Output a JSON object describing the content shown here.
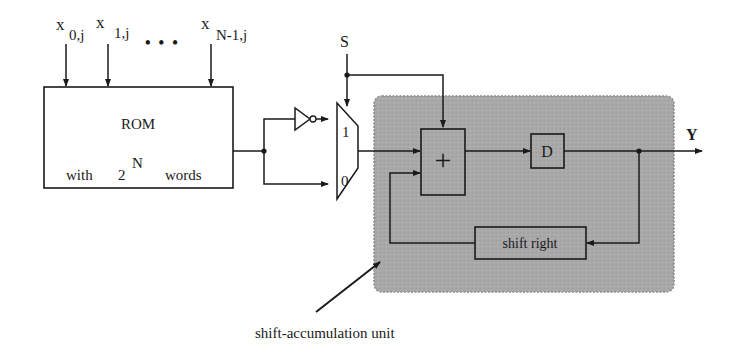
{
  "diagram": {
    "inputs": [
      {
        "var": "x",
        "sub": "0,j"
      },
      {
        "var": "x",
        "sub": "1,j"
      },
      {
        "var": "x",
        "sub": "N-1,j"
      }
    ],
    "ellipsis": "• • •",
    "rom": {
      "title": "ROM",
      "line_prefix": "with",
      "base": "2",
      "exponent": "N",
      "line_suffix": "words"
    },
    "control_signal": "S",
    "mux": {
      "input_1": "1",
      "input_0": "0"
    },
    "adder_symbol": "+",
    "delay": "D",
    "shift": "shift right",
    "output": "Y",
    "unit_caption": "shift-accumulation unit",
    "colors": {
      "unit_fill": "#a8a8a8",
      "line": "#1a1a1a",
      "background": "#ffffff"
    }
  }
}
